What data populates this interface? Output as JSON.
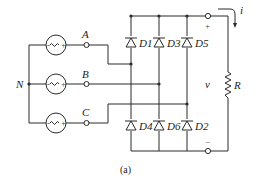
{
  "diagram": {
    "type": "three-phase full-bridge diode rectifier",
    "caption": "(a)",
    "neutral_label": "N",
    "phases": [
      {
        "label": "A",
        "y": 45
      },
      {
        "label": "B",
        "y": 84
      },
      {
        "label": "C",
        "y": 123
      }
    ],
    "diodes_top": [
      {
        "label": "D1"
      },
      {
        "label": "D3"
      },
      {
        "label": "D5"
      }
    ],
    "diodes_bottom": [
      {
        "label": "D4"
      },
      {
        "label": "D6"
      },
      {
        "label": "D2"
      }
    ],
    "output": {
      "voltage_label": "v",
      "plus_label": "+",
      "minus_label": "−",
      "current_label": "i",
      "resistor_label": "R"
    },
    "colors": {
      "line": "#2a2a2a",
      "text": "#222222",
      "background": "#ffffff"
    }
  }
}
